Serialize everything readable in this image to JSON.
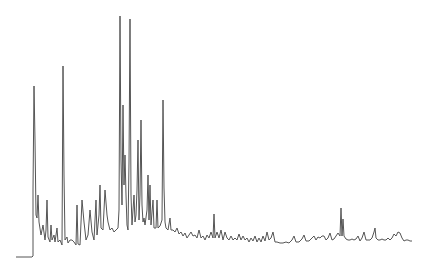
{
  "chart_data": {
    "type": "line",
    "title": "",
    "xlabel": "",
    "ylabel": "",
    "grid": false,
    "legend": null,
    "line_color": "#555555",
    "background": "#ffffff",
    "points": [
      [
        16,
        257
      ],
      [
        32,
        257
      ],
      [
        33,
        256
      ],
      [
        33,
        190
      ],
      [
        34,
        86
      ],
      [
        35,
        140
      ],
      [
        36,
        215
      ],
      [
        37,
        218
      ],
      [
        38,
        195
      ],
      [
        39,
        222
      ],
      [
        41,
        235
      ],
      [
        43,
        225
      ],
      [
        45,
        240
      ],
      [
        46,
        230
      ],
      [
        47,
        200
      ],
      [
        48,
        237
      ],
      [
        50,
        242
      ],
      [
        51,
        225
      ],
      [
        52,
        240
      ],
      [
        54,
        235
      ],
      [
        55,
        242
      ],
      [
        57,
        228
      ],
      [
        58,
        242
      ],
      [
        60,
        240
      ],
      [
        62,
        245
      ],
      [
        63,
        66
      ],
      [
        64,
        175
      ],
      [
        65,
        240
      ],
      [
        67,
        237
      ],
      [
        68,
        243
      ],
      [
        70,
        240
      ],
      [
        72,
        240
      ],
      [
        74,
        242
      ],
      [
        76,
        245
      ],
      [
        77,
        205
      ],
      [
        78,
        244
      ],
      [
        80,
        245
      ],
      [
        82,
        200
      ],
      [
        84,
        222
      ],
      [
        86,
        240
      ],
      [
        88,
        235
      ],
      [
        90,
        210
      ],
      [
        92,
        232
      ],
      [
        94,
        240
      ],
      [
        96,
        200
      ],
      [
        97,
        235
      ],
      [
        99,
        215
      ],
      [
        100,
        185
      ],
      [
        101,
        228
      ],
      [
        103,
        230
      ],
      [
        105,
        190
      ],
      [
        107,
        215
      ],
      [
        108,
        222
      ],
      [
        110,
        230
      ],
      [
        112,
        228
      ],
      [
        114,
        232
      ],
      [
        116,
        230
      ],
      [
        118,
        228
      ],
      [
        119,
        210
      ],
      [
        120,
        16
      ],
      [
        121,
        160
      ],
      [
        122,
        205
      ],
      [
        123,
        105
      ],
      [
        124,
        185
      ],
      [
        125,
        155
      ],
      [
        126,
        195
      ],
      [
        127,
        225
      ],
      [
        128,
        230
      ],
      [
        129,
        162
      ],
      [
        130,
        19
      ],
      [
        131,
        195
      ],
      [
        132,
        225
      ],
      [
        133,
        210
      ],
      [
        134,
        195
      ],
      [
        135,
        222
      ],
      [
        136,
        215
      ],
      [
        137,
        190
      ],
      [
        138,
        140
      ],
      [
        139,
        220
      ],
      [
        140,
        195
      ],
      [
        141,
        120
      ],
      [
        142,
        205
      ],
      [
        143,
        222
      ],
      [
        144,
        218
      ],
      [
        145,
        225
      ],
      [
        147,
        210
      ],
      [
        148,
        175
      ],
      [
        149,
        220
      ],
      [
        150,
        185
      ],
      [
        151,
        225
      ],
      [
        153,
        200
      ],
      [
        154,
        228
      ],
      [
        156,
        228
      ],
      [
        157,
        200
      ],
      [
        158,
        228
      ],
      [
        160,
        226
      ],
      [
        162,
        220
      ],
      [
        163,
        100
      ],
      [
        164,
        188
      ],
      [
        165,
        222
      ],
      [
        166,
        228
      ],
      [
        168,
        230
      ],
      [
        170,
        218
      ],
      [
        171,
        230
      ],
      [
        173,
        230
      ],
      [
        175,
        232
      ],
      [
        177,
        228
      ],
      [
        179,
        234
      ],
      [
        181,
        232
      ],
      [
        183,
        236
      ],
      [
        185,
        233
      ],
      [
        187,
        238
      ],
      [
        189,
        235
      ],
      [
        191,
        232
      ],
      [
        193,
        236
      ],
      [
        195,
        235
      ],
      [
        197,
        238
      ],
      [
        199,
        230
      ],
      [
        201,
        238
      ],
      [
        203,
        236
      ],
      [
        205,
        240
      ],
      [
        207,
        235
      ],
      [
        209,
        238
      ],
      [
        211,
        232
      ],
      [
        213,
        238
      ],
      [
        214,
        214
      ],
      [
        215,
        238
      ],
      [
        217,
        232
      ],
      [
        219,
        238
      ],
      [
        221,
        230
      ],
      [
        223,
        240
      ],
      [
        225,
        232
      ],
      [
        227,
        238
      ],
      [
        229,
        240
      ],
      [
        231,
        236
      ],
      [
        233,
        240
      ],
      [
        235,
        238
      ],
      [
        237,
        240
      ],
      [
        239,
        234
      ],
      [
        241,
        240
      ],
      [
        243,
        236
      ],
      [
        245,
        240
      ],
      [
        247,
        238
      ],
      [
        249,
        242
      ],
      [
        251,
        238
      ],
      [
        253,
        241
      ],
      [
        255,
        236
      ],
      [
        257,
        242
      ],
      [
        259,
        238
      ],
      [
        261,
        242
      ],
      [
        263,
        236
      ],
      [
        265,
        241
      ],
      [
        267,
        232
      ],
      [
        269,
        240
      ],
      [
        271,
        238
      ],
      [
        273,
        232
      ],
      [
        275,
        242
      ],
      [
        277,
        242
      ],
      [
        280,
        243
      ],
      [
        283,
        243
      ],
      [
        286,
        242
      ],
      [
        289,
        243
      ],
      [
        292,
        240
      ],
      [
        294,
        236
      ],
      [
        296,
        242
      ],
      [
        299,
        242
      ],
      [
        302,
        239
      ],
      [
        304,
        235
      ],
      [
        306,
        241
      ],
      [
        309,
        241
      ],
      [
        312,
        238
      ],
      [
        314,
        236
      ],
      [
        316,
        240
      ],
      [
        318,
        237
      ],
      [
        320,
        238
      ],
      [
        322,
        236
      ],
      [
        324,
        236
      ],
      [
        326,
        240
      ],
      [
        328,
        238
      ],
      [
        330,
        233
      ],
      [
        332,
        240
      ],
      [
        334,
        239
      ],
      [
        336,
        236
      ],
      [
        338,
        233
      ],
      [
        340,
        236
      ],
      [
        341,
        208
      ],
      [
        342,
        236
      ],
      [
        343,
        219
      ],
      [
        344,
        236
      ],
      [
        346,
        239
      ],
      [
        348,
        240
      ],
      [
        350,
        240
      ],
      [
        352,
        239
      ],
      [
        354,
        240
      ],
      [
        356,
        239
      ],
      [
        358,
        236
      ],
      [
        360,
        241
      ],
      [
        362,
        238
      ],
      [
        364,
        232
      ],
      [
        366,
        240
      ],
      [
        368,
        240
      ],
      [
        370,
        240
      ],
      [
        372,
        238
      ],
      [
        374,
        232
      ],
      [
        375,
        228
      ],
      [
        376,
        238
      ],
      [
        378,
        240
      ],
      [
        380,
        240
      ],
      [
        382,
        239
      ],
      [
        384,
        240
      ],
      [
        386,
        240
      ],
      [
        388,
        238
      ],
      [
        390,
        240
      ],
      [
        392,
        238
      ],
      [
        394,
        234
      ],
      [
        396,
        236
      ],
      [
        398,
        232
      ],
      [
        400,
        233
      ],
      [
        402,
        238
      ],
      [
        404,
        241
      ],
      [
        406,
        240
      ],
      [
        408,
        240
      ],
      [
        410,
        241
      ],
      [
        412,
        241
      ]
    ],
    "major_peaks_x_px": [
      34,
      63,
      120,
      123,
      130,
      138,
      141,
      163,
      341,
      343
    ],
    "major_peaks_top_y_px": [
      86,
      66,
      16,
      105,
      19,
      140,
      120,
      100,
      208,
      219
    ]
  }
}
